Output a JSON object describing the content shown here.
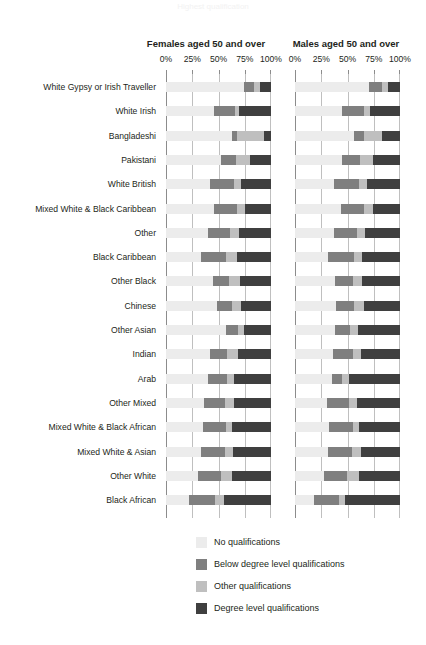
{
  "title_faint": "Highest qualification",
  "panels": [
    {
      "key": "female",
      "label": "Females aged  50 and over"
    },
    {
      "key": "male",
      "label": "Males aged 50 and over"
    }
  ],
  "axis": {
    "ticks": [
      "0%",
      "25%",
      "50%",
      "75%",
      "100%"
    ],
    "values": [
      0,
      25,
      50,
      75,
      100
    ]
  },
  "legend": {
    "items": [
      {
        "label": "No qualifications",
        "color": "#ececec"
      },
      {
        "label": "Below degree level qualifications",
        "color": "#7f7f7f"
      },
      {
        "label": "Other qualifications",
        "color": "#bfbfbf"
      },
      {
        "label": "Degree level qualifications",
        "color": "#3f3f3f"
      }
    ]
  },
  "colors": {
    "no_qual": "#ececec",
    "below_degree": "#7f7f7f",
    "other_qual": "#bfbfbf",
    "degree": "#3f3f3f",
    "gridline": "#bfbfbf",
    "axis": "#8c8c8c",
    "text": "#231f20"
  },
  "chart_data": {
    "type": "bar",
    "orientation": "horizontal",
    "stacked": true,
    "stack_total": 100,
    "title": "Highest qualification",
    "xlabel": "",
    "ylabel": "",
    "xlim": [
      0,
      100
    ],
    "grid": true,
    "legend_position": "bottom",
    "series_order": [
      "No qualifications",
      "Below degree level qualifications",
      "Other qualifications",
      "Degree level qualifications"
    ],
    "categories": [
      "White Gypsy or Irish Traveller",
      "White Irish",
      "Bangladeshi",
      "Pakistani",
      "White British",
      "Mixed White & Black Caribbean",
      "Other",
      "Black Caribbean",
      "Other Black",
      "Chinese",
      "Other Asian",
      "Indian",
      "Arab",
      "Other Mixed",
      "Mixed White & Black African",
      "Mixed White & Asian",
      "Other White",
      "Black African"
    ],
    "panels": [
      {
        "name": "Females aged  50 and over",
        "series": [
          {
            "name": "No qualifications",
            "values": [
              74,
              46,
              63,
              52,
              42,
              46,
              40,
              33,
              45,
              49,
              57,
              42,
              40,
              36,
              35,
              33,
              30,
              22
            ]
          },
          {
            "name": "Below degree level qualifications",
            "values": [
              10,
              20,
              5,
              15,
              23,
              22,
              21,
              24,
              15,
              14,
              12,
              16,
              18,
              20,
              22,
              23,
              22,
              25
            ]
          },
          {
            "name": "Other qualifications",
            "values": [
              6,
              4,
              25,
              13,
              6,
              7,
              9,
              11,
              10,
              8,
              5,
              11,
              7,
              9,
              6,
              8,
              11,
              8
            ]
          },
          {
            "name": "Degree level qualifications",
            "values": [
              10,
              30,
              7,
              20,
              29,
              25,
              30,
              32,
              30,
              29,
              26,
              31,
              35,
              35,
              37,
              36,
              37,
              45
            ]
          }
        ]
      },
      {
        "name": "Males aged 50 and over",
        "series": [
          {
            "name": "No qualifications",
            "values": [
              70,
              45,
              56,
              45,
              37,
              44,
              37,
              31,
              38,
              39,
              38,
              36,
              35,
              30,
              32,
              31,
              28,
              18
            ]
          },
          {
            "name": "Below degree level qualifications",
            "values": [
              13,
              21,
              10,
              17,
              24,
              22,
              22,
              25,
              17,
              17,
              14,
              19,
              10,
              21,
              23,
              23,
              22,
              24
            ]
          },
          {
            "name": "Other qualifications",
            "values": [
              6,
              5,
              17,
              12,
              8,
              8,
              8,
              8,
              9,
              10,
              8,
              8,
              6,
              8,
              6,
              9,
              11,
              6
            ]
          },
          {
            "name": "Degree level qualifications",
            "values": [
              11,
              29,
              17,
              26,
              31,
              26,
              33,
              36,
              36,
              34,
              40,
              37,
              49,
              41,
              39,
              37,
              39,
              52
            ]
          }
        ]
      }
    ]
  }
}
